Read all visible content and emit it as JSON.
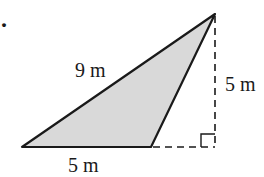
{
  "figure": {
    "marker": ".",
    "colors": {
      "fill": "#d9d9d9",
      "stroke": "#1a1a1a",
      "background": "#ffffff"
    },
    "triangle": {
      "vertices": {
        "bottom_left": [
          22,
          147
        ],
        "bottom_right": [
          151,
          147
        ],
        "apex": [
          215,
          14
        ]
      }
    },
    "labels": {
      "hypotenuse": "9 m",
      "height": "5 m",
      "base": "5 m"
    },
    "right_angle_marker": true,
    "dashed_lines": [
      "height",
      "base-extension"
    ]
  }
}
